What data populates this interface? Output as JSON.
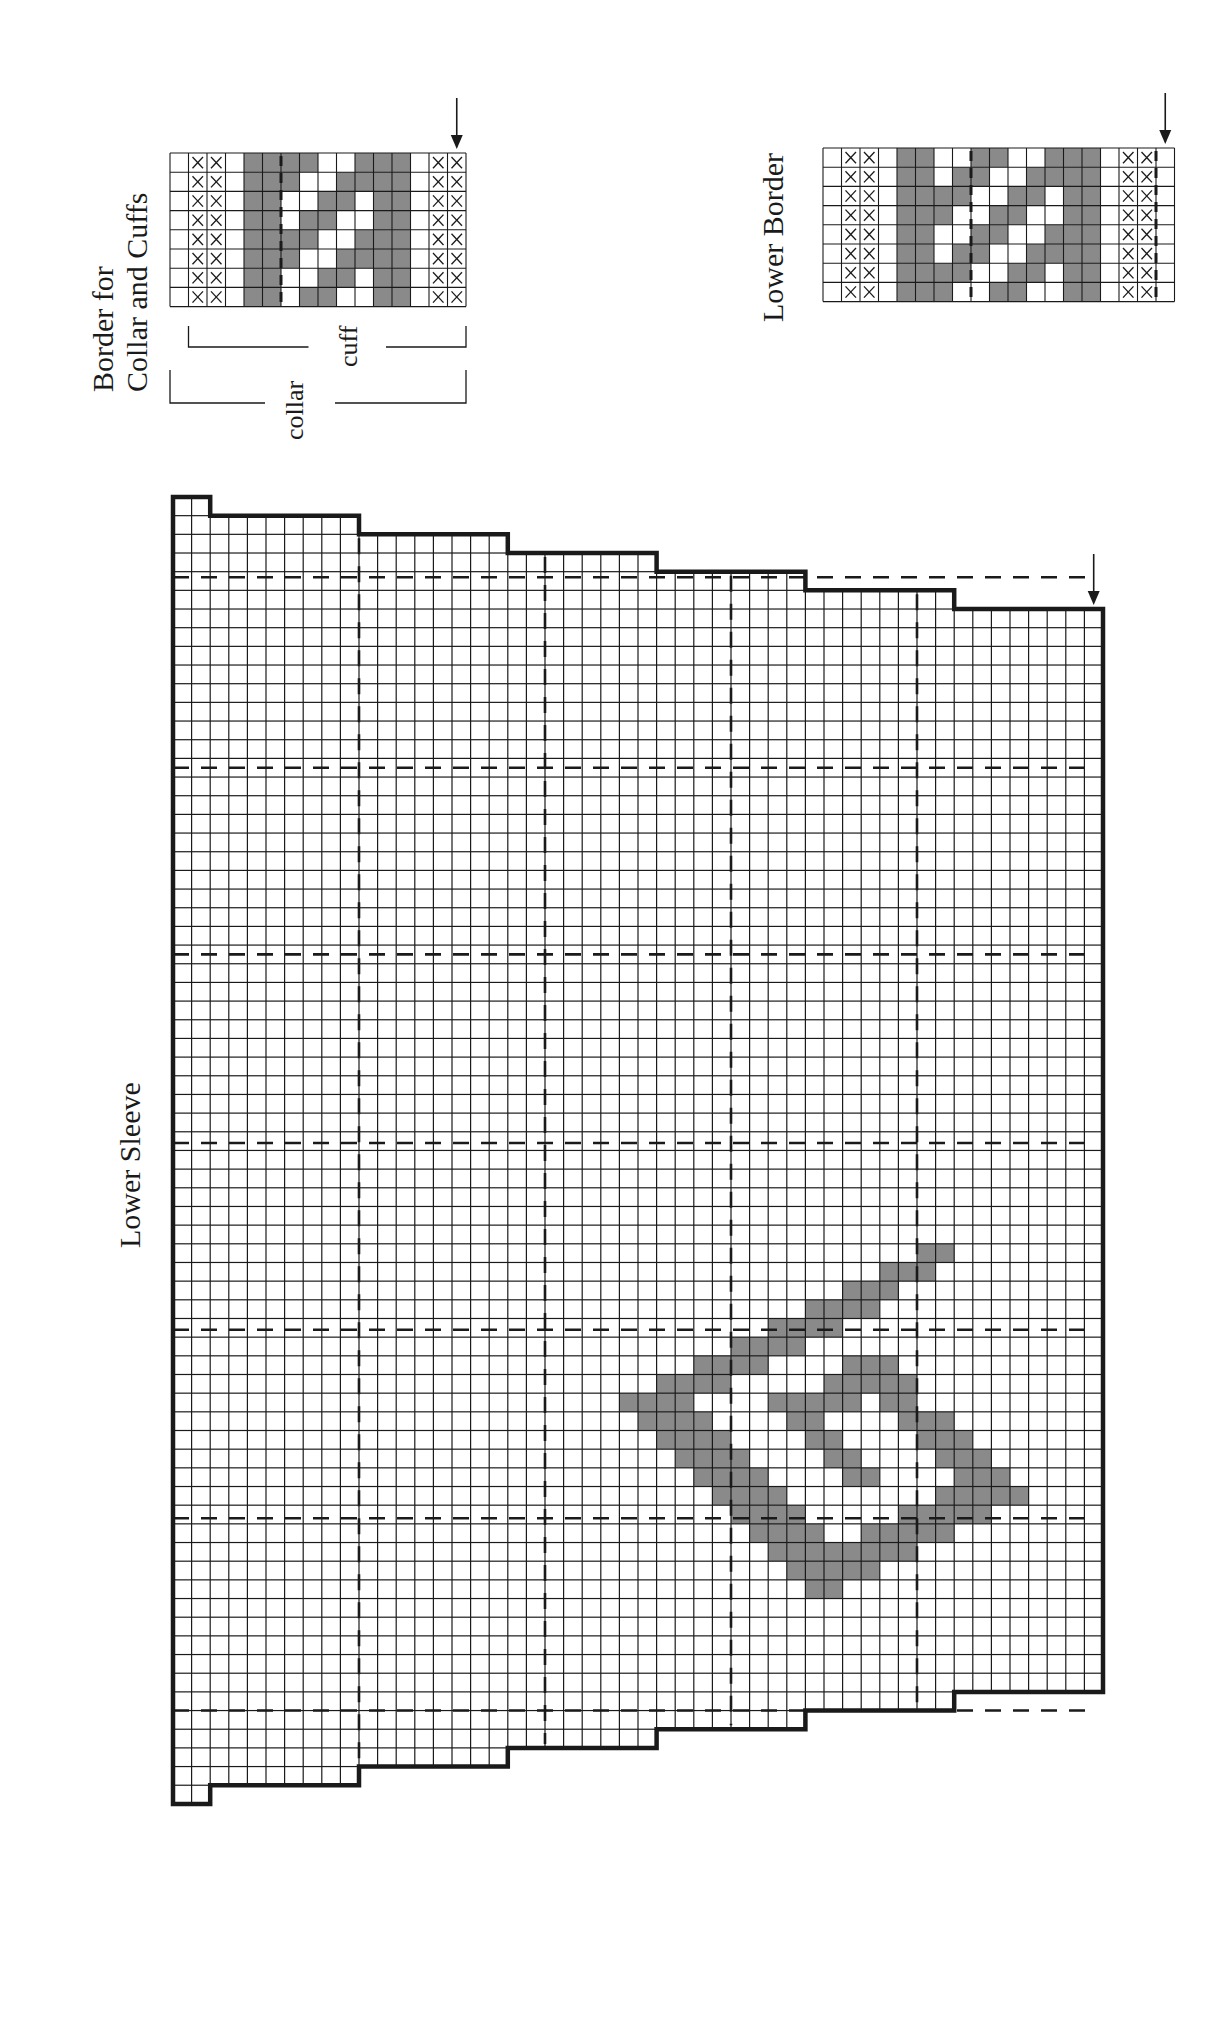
{
  "labels": {
    "collar_chart_title_line1": "Border for",
    "collar_chart_title_line2": "Collar and Cuffs",
    "cuff_bracket": "cuff",
    "collar_bracket": "collar",
    "lower_border_title": "Lower Border",
    "sleeve_title": "Lower Sleeve"
  },
  "colors": {
    "grid": "#1a1a1a",
    "contrast_fill": "#8a8a8a",
    "background": "#ffffff"
  },
  "legend": {
    "x_symbol": "×",
    "x_meaning": "border stitch (marked)",
    "gray_meaning": "contrast color"
  },
  "collar_chart": {
    "cols": 16,
    "rows": 8,
    "x_cols": [
      1,
      2,
      14,
      15
    ],
    "gray_rows": [
      [
        4,
        5,
        6,
        7,
        10,
        11,
        12
      ],
      [
        4,
        5,
        6,
        9,
        10,
        11,
        12
      ],
      [
        4,
        5,
        8,
        9,
        11,
        12
      ],
      [
        4,
        5,
        7,
        8,
        11,
        12
      ],
      [
        4,
        5,
        6,
        7,
        10,
        11,
        12
      ],
      [
        4,
        5,
        6,
        9,
        10,
        11,
        12
      ],
      [
        4,
        5,
        8,
        9,
        11,
        12
      ],
      [
        4,
        5,
        7,
        8,
        11,
        12
      ]
    ],
    "center_marker_col_boundary": 6,
    "start_arrow_col": 15
  },
  "lower_border_chart": {
    "cols": 19,
    "rows": 8,
    "x_cols": [
      1,
      2,
      16,
      17
    ],
    "gray_rows": [
      [
        4,
        5,
        8,
        9,
        12,
        13,
        14
      ],
      [
        4,
        5,
        7,
        8,
        11,
        12,
        13,
        14
      ],
      [
        4,
        5,
        6,
        7,
        10,
        11,
        13,
        14
      ],
      [
        4,
        5,
        6,
        9,
        10,
        13,
        14
      ],
      [
        4,
        5,
        8,
        9,
        12,
        13,
        14
      ],
      [
        4,
        5,
        7,
        8,
        11,
        12,
        13,
        14
      ],
      [
        4,
        5,
        6,
        7,
        10,
        11,
        13,
        14
      ],
      [
        4,
        5,
        6,
        9,
        10,
        13,
        14
      ]
    ],
    "center_marker_col_boundary": 8,
    "edge_marker_col_boundary": 18,
    "start_arrow_col": 18
  },
  "sleeve_chart": {
    "cols": 50,
    "rows": 70,
    "column_groups": [
      {
        "from": 0,
        "to": 1,
        "top_row": 0,
        "bottom_row": 70
      },
      {
        "from": 2,
        "to": 9,
        "top_row": 1,
        "bottom_row": 69
      },
      {
        "from": 10,
        "to": 17,
        "top_row": 2,
        "bottom_row": 68
      },
      {
        "from": 18,
        "to": 25,
        "top_row": 3,
        "bottom_row": 67
      },
      {
        "from": 26,
        "to": 33,
        "top_row": 4,
        "bottom_row": 66
      },
      {
        "from": 34,
        "to": 41,
        "top_row": 5,
        "bottom_row": 65
      },
      {
        "from": 42,
        "to": 49,
        "top_row": 6,
        "bottom_row": 64
      }
    ],
    "dashed_vertical_cols": [
      10,
      20,
      30,
      40
    ],
    "dashed_horizontal_rows": [
      4.3,
      14.5,
      24.5,
      34.6,
      44.6,
      54.7,
      65.0
    ],
    "start_arrow_col": 49,
    "motif_gray": {
      "40": [
        40,
        41
      ],
      "41": [
        38,
        39,
        40
      ],
      "42": [
        36,
        37,
        38
      ],
      "43": [
        34,
        35,
        36,
        37
      ],
      "44": [
        32,
        33,
        34,
        35
      ],
      "45": [
        30,
        31,
        32,
        33
      ],
      "46": [
        28,
        29,
        30,
        31,
        36,
        37,
        38
      ],
      "47": [
        26,
        27,
        28,
        29,
        35,
        36,
        37,
        38,
        39
      ],
      "48": [
        24,
        25,
        26,
        27,
        32,
        33,
        34,
        35,
        36,
        38,
        39
      ],
      "49": [
        25,
        26,
        27,
        28,
        33,
        34,
        39,
        40,
        41
      ],
      "50": [
        26,
        27,
        28,
        29,
        34,
        35,
        40,
        41,
        42
      ],
      "51": [
        27,
        28,
        29,
        30,
        35,
        36,
        41,
        42,
        43
      ],
      "52": [
        28,
        29,
        30,
        31,
        36,
        37,
        42,
        43,
        44
      ],
      "53": [
        29,
        30,
        31,
        32,
        41,
        42,
        43,
        44,
        45
      ],
      "54": [
        30,
        31,
        32,
        33,
        39,
        40,
        41,
        42,
        43
      ],
      "55": [
        31,
        32,
        33,
        34,
        37,
        38,
        39,
        40,
        41
      ],
      "56": [
        32,
        33,
        34,
        35,
        36,
        37,
        38,
        39
      ],
      "57": [
        33,
        34,
        35,
        36,
        37
      ],
      "58": [
        34,
        35
      ]
    }
  }
}
